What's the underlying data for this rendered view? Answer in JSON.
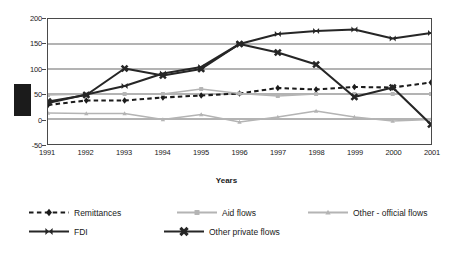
{
  "chart_data": {
    "type": "line",
    "title": "",
    "xlabel": "Years",
    "ylabel": "",
    "grid": true,
    "legend_position": "bottom",
    "categories": [
      "1991",
      "1992",
      "1993",
      "1994",
      "1995",
      "1996",
      "1997",
      "1998",
      "1999",
      "2000",
      "2001"
    ],
    "xlim": [
      1991,
      2001
    ],
    "ylim": [
      -50,
      200
    ],
    "yticks": [
      200,
      150,
      100,
      50,
      0,
      -50
    ],
    "series": [
      {
        "name": "Remittances",
        "color": "#1b1b1b",
        "style": "dashed",
        "marker": "diamond",
        "values": [
          28,
          37,
          37,
          43,
          47,
          51,
          62,
          59,
          64,
          63,
          73
        ]
      },
      {
        "name": "Aid flows",
        "color": "#b4b4b4",
        "style": "solid",
        "marker": "square",
        "values": [
          48,
          50,
          50,
          50,
          60,
          51,
          46,
          50,
          50,
          50,
          50
        ]
      },
      {
        "name": "Other - official flows",
        "color": "#b4b4b4",
        "style": "solid",
        "marker": "triangle",
        "values": [
          12,
          11,
          11,
          -1,
          9,
          -6,
          4,
          16,
          4,
          -4,
          -1
        ]
      },
      {
        "name": "FDI",
        "color": "#262626",
        "style": "solid",
        "marker": "bowtie",
        "values": [
          32,
          49,
          66,
          91,
          104,
          150,
          170,
          176,
          179,
          161,
          172
        ]
      },
      {
        "name": "Other private flows",
        "color": "#262626",
        "style": "solid",
        "marker": "asterisk",
        "values": [
          35,
          48,
          101,
          87,
          100,
          150,
          133,
          109,
          44,
          63,
          -11
        ]
      }
    ]
  },
  "annotations": {
    "redaction_block": "black-redaction-bar"
  }
}
